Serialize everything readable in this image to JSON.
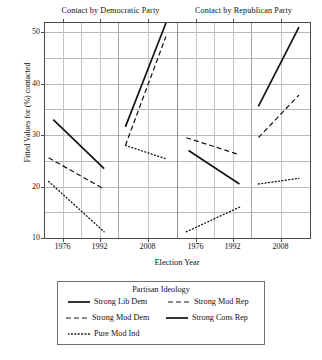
{
  "chart_data": {
    "type": "line",
    "title": "",
    "xlabel": "Election Year",
    "ylabel": "Fitted Values for (%) contacted",
    "ylim": [
      10,
      52
    ],
    "yticks": [
      10,
      20,
      30,
      40,
      50
    ],
    "ygrid_values": [
      10,
      15,
      20,
      25,
      30,
      35,
      40,
      45,
      50
    ],
    "grid": true,
    "legend_position": "below",
    "legend_title": "Partisan Ideology",
    "panels": [
      {
        "name": "Contact by Democratic Party",
        "subpanels": [
          {
            "xticks": [
              1976,
              1992
            ],
            "xrange": [
              1968,
              2000
            ],
            "series": [
              {
                "name": "Strong Lib Dem",
                "style": "solid",
                "x": [
                  1972,
                  1994
                ],
                "y": [
                  33.0,
                  23.5
                ]
              },
              {
                "name": "Strong Mod Dem",
                "style": "dashed",
                "x": [
                  1970,
                  1994
                ],
                "y": [
                  25.6,
                  19.5
                ]
              },
              {
                "name": "Pure Mod Ind",
                "style": "dotted",
                "x": [
                  1970,
                  1994
                ],
                "y": [
                  21.0,
                  11.2
                ]
              }
            ]
          },
          {
            "xticks": [
              2008
            ],
            "xrange": [
              2000,
              2016
            ],
            "series": [
              {
                "name": "Strong Lib Dem",
                "style": "solid",
                "x": [
                  2002,
                  2013
                ],
                "y": [
                  31.6,
                  51.8
                ]
              },
              {
                "name": "Strong Mod Dem",
                "style": "dashed",
                "x": [
                  2002,
                  2013
                ],
                "y": [
                  28.0,
                  49.2
                ]
              },
              {
                "name": "Pure Mod Ind",
                "style": "dotted",
                "x": [
                  2002,
                  2013
                ],
                "y": [
                  28.0,
                  25.4
                ]
              }
            ]
          }
        ]
      },
      {
        "name": "Contact by Republican Party",
        "subpanels": [
          {
            "xticks": [
              1976,
              1992
            ],
            "xrange": [
              1968,
              2000
            ],
            "series": [
              {
                "name": "Strong Mod Rep",
                "style": "dashed",
                "x": [
                  1972,
                  1995
                ],
                "y": [
                  29.5,
                  26.2
                ]
              },
              {
                "name": "Strong Cons Rep",
                "style": "solid",
                "x": [
                  1973,
                  1995
                ],
                "y": [
                  27.0,
                  20.5
                ]
              },
              {
                "name": "Pure Mod Ind",
                "style": "dotted",
                "x": [
                  1972,
                  1996
                ],
                "y": [
                  11.2,
                  16.2
                ]
              }
            ]
          },
          {
            "xticks": [
              2008
            ],
            "xrange": [
              2000,
              2016
            ],
            "series": [
              {
                "name": "Strong Cons Rep",
                "style": "solid",
                "x": [
                  2002,
                  2013
                ],
                "y": [
                  35.6,
                  51.0
                ]
              },
              {
                "name": "Strong Mod Rep",
                "style": "dashed",
                "x": [
                  2002,
                  2013
                ],
                "y": [
                  29.5,
                  37.8
                ]
              },
              {
                "name": "Pure Mod Ind",
                "style": "dotted",
                "x": [
                  2002,
                  2013
                ],
                "y": [
                  20.5,
                  21.6
                ]
              }
            ]
          }
        ]
      }
    ],
    "legend_entries": [
      {
        "label": "Strong Lib Dem",
        "style": "solid"
      },
      {
        "label": "Strong Mod Rep",
        "style": "dashed"
      },
      {
        "label": "Strong Mod Dem",
        "style": "dashed"
      },
      {
        "label": "Strong Cons Rep",
        "style": "solid"
      },
      {
        "label": "Pure Mod Ind",
        "style": "dotted"
      }
    ],
    "colors": {
      "line": "#141414",
      "grid": "#b9b9b9",
      "axis": "#4a4a4a",
      "background": "#ffffff"
    }
  },
  "axes": {
    "y_title": "Fitted Values for (%) contacted",
    "x_title": "Election Year",
    "y_labels": [
      "50",
      "40",
      "30",
      "20",
      "10"
    ],
    "x_labels": [
      "1976",
      "1992",
      "2008",
      "1976",
      "1992",
      "2008"
    ]
  },
  "panel_headers": {
    "left": "Contact by Democratic Party",
    "right": "Contact by Republican Party"
  },
  "legend": {
    "title": "Partisan Ideology",
    "items": [
      {
        "label": "Strong Lib Dem"
      },
      {
        "label": "Strong Mod Rep"
      },
      {
        "label": "Strong Mod Dem"
      },
      {
        "label": "Strong Cons Rep"
      },
      {
        "label": "Pure Mod Ind"
      }
    ]
  }
}
